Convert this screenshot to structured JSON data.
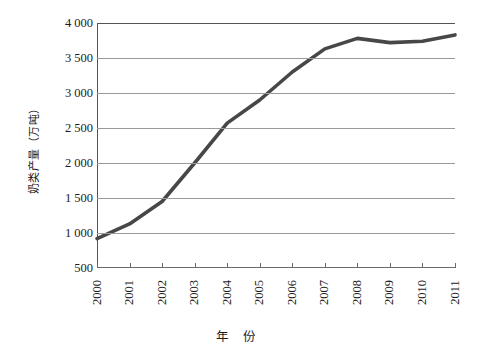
{
  "chart_data": {
    "type": "line",
    "title": "",
    "subtitle": "",
    "xlabel": "年 份",
    "ylabel": "奶类产量（万吨）",
    "x": [
      2000,
      2001,
      2002,
      2003,
      2004,
      2005,
      2006,
      2007,
      2008,
      2009,
      2010,
      2011
    ],
    "categories": [
      "2000",
      "2001",
      "2002",
      "2003",
      "2004",
      "2005",
      "2006",
      "2007",
      "2008",
      "2009",
      "2010",
      "2011"
    ],
    "values": [
      920,
      1130,
      1450,
      2000,
      2570,
      2900,
      3300,
      3630,
      3780,
      3720,
      3740,
      3830
    ],
    "series": [
      {
        "name": "奶类产量",
        "values": [
          920,
          1130,
          1450,
          2000,
          2570,
          2900,
          3300,
          3630,
          3780,
          3720,
          3740,
          3830
        ],
        "color": "#474747"
      }
    ],
    "ylim": [
      500,
      4000
    ],
    "xlim": [
      2000,
      2011
    ],
    "y_ticks": [
      500,
      1000,
      1500,
      2000,
      2500,
      3000,
      3500,
      4000
    ],
    "y_tick_labels": [
      "500",
      "1 000",
      "1 500",
      "2 000",
      "2 500",
      "3 000",
      "3 500",
      "4 000"
    ],
    "grid": true,
    "grid_axis": "y",
    "legend": false,
    "legend_position": "none",
    "line_width": 3.6,
    "marker": "none"
  },
  "axes": {
    "y_title": "奶类产量（万吨）",
    "x_title": "年 份"
  },
  "colors": {
    "line": "#474747",
    "grid": "#9a9a9a",
    "frame": "#555555",
    "text": "#1c1c1c",
    "background": "#ffffff"
  }
}
